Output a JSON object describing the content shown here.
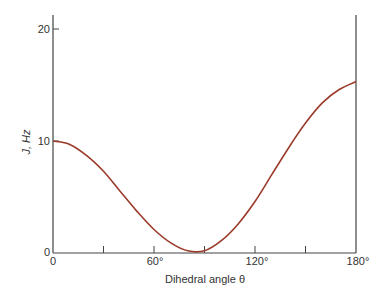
{
  "chart_data": {
    "type": "line",
    "title": "",
    "xlabel": "Dihedral angle θ",
    "ylabel": "J, Hz",
    "xlim": [
      0,
      180
    ],
    "ylim": [
      0,
      20
    ],
    "grid": false,
    "legend": null,
    "x_ticks": [
      0,
      30,
      60,
      90,
      120,
      150,
      180
    ],
    "x_tick_labels": [
      "0",
      "",
      "60°",
      "",
      "120°",
      "",
      "180°"
    ],
    "y_ticks": [
      0,
      10,
      20
    ],
    "y_tick_labels": [
      "0",
      "10",
      "20"
    ],
    "series": [
      {
        "name": "J vs dihedral angle",
        "color": "#9b3b2b",
        "x": [
          0,
          10,
          20,
          30,
          40,
          50,
          60,
          70,
          80,
          90,
          100,
          110,
          120,
          130,
          140,
          150,
          160,
          170,
          180
        ],
        "values": [
          10.0,
          9.7,
          8.7,
          7.3,
          5.5,
          3.7,
          2.1,
          0.9,
          0.2,
          0.2,
          1.1,
          2.6,
          4.6,
          7.0,
          9.4,
          11.6,
          13.4,
          14.6,
          15.3
        ]
      }
    ]
  },
  "labels": {
    "x_axis_title": "Dihedral angle θ",
    "y_axis_title": "J, Hz",
    "y_tick_0": "0",
    "y_tick_10": "10",
    "y_tick_20": "20",
    "x_tick_0": "0",
    "x_tick_60": "60°",
    "x_tick_120": "120°",
    "x_tick_180": "180°"
  }
}
